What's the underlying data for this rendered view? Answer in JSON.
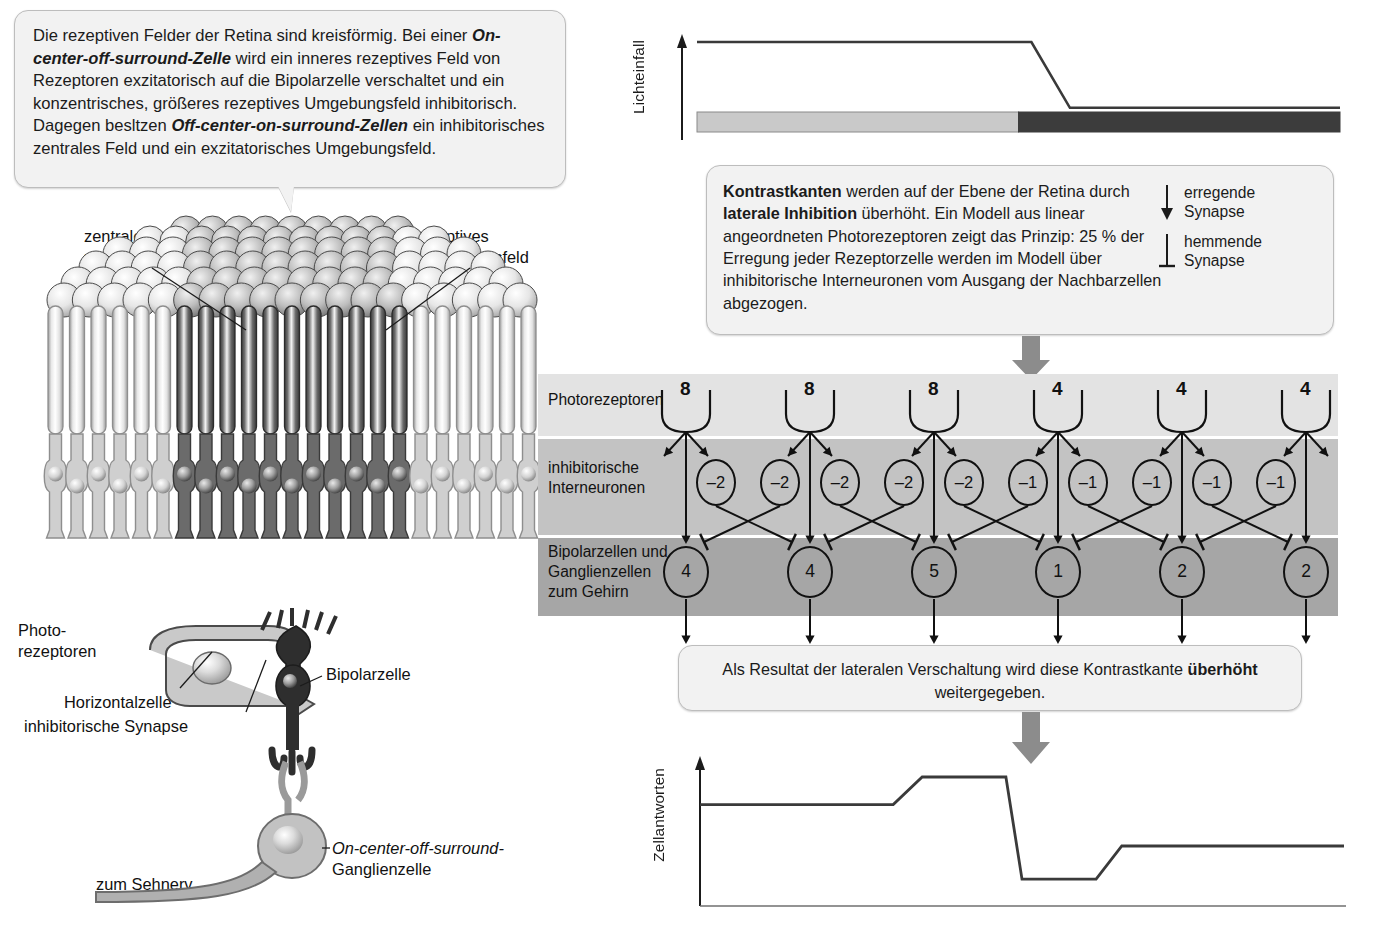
{
  "intro_callout": {
    "name": "receptive-fields-explanation",
    "segments": [
      {
        "text": "Die rezeptiven Felder der Retina sind kreisförmig. Bei einer ",
        "bold": false
      },
      {
        "text": "On-center-off-surround-Zelle",
        "bold": true
      },
      {
        "text": " wird ein inneres rezeptives Feld von Rezeptoren exzitatorisch auf die Bipolarzelle verschaltet und ein konzentrisches, größeres rezeptives Umgebungsfeld inhibitorisch. Dagegen besltzen ",
        "bold": false
      },
      {
        "text": "Off-center-on-surround-Zellen",
        "bold": true
      },
      {
        "text": " ein inhibitorisches zentrales Feld und ein exzitatorisches Umgebungsfeld.",
        "bold": false
      }
    ]
  },
  "contrast_callout": {
    "segments": [
      {
        "text": "Kontrastkanten",
        "bold": true
      },
      {
        "text": " werden auf der Ebene der Retina durch ",
        "bold": false
      },
      {
        "text": "laterale Inhibition",
        "bold": true
      },
      {
        "text": " überhöht. Ein Modell aus linear angeordneten Photorezeptoren zeigt das Prinzip: 25 % der Erregung jeder Rezeptorzelle werden im Modell über inhibitorische Interneuronen vom Ausgang der Nachbarzellen abgezogen.",
        "bold": false
      }
    ]
  },
  "result_callout": {
    "segments": [
      {
        "text": "Als Resultat der lateralen Verschaltung wird diese Kontrastkante ",
        "bold": false
      },
      {
        "text": "überhöht",
        "bold": true
      },
      {
        "text": " weitergegeben.",
        "bold": false
      }
    ]
  },
  "legend": {
    "excitatory": {
      "line1": "erregende",
      "line2": "Synapse",
      "icon": "arrow-down-filled-icon"
    },
    "inhibitory": {
      "line1": "hemmende",
      "line2": "Synapse",
      "icon": "t-bar-icon"
    }
  },
  "retina_figure": {
    "label_center_field": "zentrales\nrezeptives Feld",
    "label_surround_field": "rezeptives\nUmgebungsfeld",
    "label_photoreceptors": "Photo-\nrezeptoren",
    "label_horizontal_cell": "Horizontalzelle",
    "label_inhibitory_synapse": "inhibitorische Synapse",
    "label_bipolar_cell": "Bipolarzelle",
    "label_ganglion_italic": "On-center-off-surround-",
    "label_ganglion_rest": "Ganglienzelle",
    "label_optic_nerve": "zum Sehnerv"
  },
  "network": {
    "layer_labels": {
      "photoreceptors": "Photorezeptoren",
      "interneurons": "inhibitorische\nInterneuronen",
      "ganglion": "Bipolarzellen und\nGanglienzellen\nzum Gehirn"
    },
    "photoreceptor_values": [
      "8",
      "8",
      "8",
      "4",
      "4",
      "4"
    ],
    "interneuron_values": [
      "–2",
      "–2",
      "–2",
      "–2",
      "–2",
      "–1",
      "–1",
      "–1",
      "–1",
      "–1"
    ],
    "ganglion_values": [
      "4",
      "4",
      "5",
      "1",
      "2",
      "2"
    ]
  },
  "chart_data": [
    {
      "type": "line",
      "name": "lichteinfall",
      "ylabel": "Lichteinfall",
      "title": "",
      "xlabel": "",
      "x": [
        0,
        0.52,
        0.58,
        1.0
      ],
      "values": [
        1.0,
        1.0,
        0.3,
        0.3
      ],
      "ylim": [
        0,
        1.15
      ],
      "grid": false,
      "legend": "none",
      "annotation_bar": {
        "light_fraction": 0.5,
        "light_color": "#c9c9c9",
        "dark_color": "#3c3c3c"
      }
    },
    {
      "type": "line",
      "name": "zellantworten",
      "ylabel": "Zellantworten",
      "title": "",
      "xlabel": "",
      "categories": [
        "4",
        "4",
        "5",
        "1",
        "2",
        "2"
      ],
      "x": [
        0,
        0.3,
        0.345,
        0.475,
        0.5,
        0.615,
        0.655,
        1.0
      ],
      "values": [
        0.72,
        0.72,
        0.92,
        0.92,
        0.18,
        0.18,
        0.42,
        0.42
      ],
      "ylim": [
        0,
        1.1
      ],
      "grid": false,
      "legend": "none"
    }
  ],
  "colors": {
    "band_photoreceptor": "#e3e3e3",
    "band_interneuron": "#c3c3c3",
    "band_ganglion": "#a6a6a6",
    "callout_bg": "#f2f2f2",
    "callout_border": "#bdbdbd",
    "block_arrow": "#8c8c8c",
    "ink": "#1b1b1b"
  }
}
